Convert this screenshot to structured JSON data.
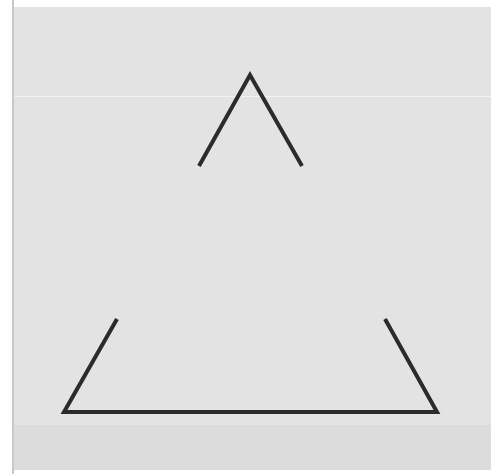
{
  "figure": {
    "title": "",
    "background_color": "#e3e3e3",
    "band_color": "#dcdcdc",
    "stroke_color": "#2b2b2b",
    "stroke_width": 4,
    "fragments": [
      {
        "name": "top-apex",
        "points": [
          [
            199,
            166
          ],
          [
            250,
            75
          ],
          [
            302,
            166
          ]
        ]
      },
      {
        "name": "bottom-left-corner",
        "points": [
          [
            117,
            319
          ],
          [
            64,
            412
          ],
          [
            250,
            412
          ]
        ]
      },
      {
        "name": "bottom-right-corner",
        "points": [
          [
            250,
            412
          ],
          [
            437,
            412
          ],
          [
            385,
            319
          ]
        ]
      }
    ]
  }
}
